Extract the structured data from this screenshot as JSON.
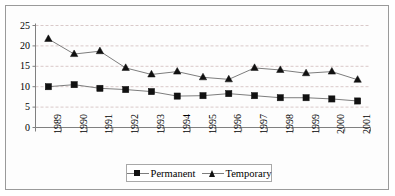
{
  "chart_data": {
    "type": "line",
    "title": "",
    "subtitle": "",
    "xlabel": "",
    "ylabel": "",
    "categories": [
      "1989",
      "1990",
      "1991",
      "1992",
      "1993",
      "1994",
      "1995",
      "1996",
      "1997",
      "1998",
      "1999",
      "2000",
      "2001"
    ],
    "series": [
      {
        "name": "Permanent",
        "marker": "square",
        "values": [
          10.0,
          10.5,
          9.6,
          9.3,
          8.8,
          7.7,
          7.8,
          8.3,
          7.8,
          7.3,
          7.3,
          7.0,
          6.5
        ]
      },
      {
        "name": "Temporary",
        "marker": "triangle",
        "values": [
          21.7,
          18.0,
          18.7,
          14.6,
          13.0,
          13.7,
          12.3,
          11.8,
          14.6,
          14.1,
          13.3,
          13.7,
          11.7
        ]
      }
    ],
    "ylim": [
      0,
      25
    ],
    "yticks": [
      0,
      5,
      10,
      15,
      20,
      25
    ],
    "ytick_labels": [
      "0",
      "5",
      "10",
      "15",
      "20",
      "25"
    ],
    "xtick_labels": [
      "1989",
      "1990",
      "1991",
      "1992",
      "1993",
      "1994",
      "1995",
      "1996",
      "1997",
      "1998",
      "1999",
      "2000",
      "2001"
    ],
    "xtick_rotation": 90,
    "grid": true,
    "grid_axis": "y",
    "grid_style": "dashed",
    "legend_position": "bottom-center",
    "colors": {
      "line": "#7d7d7d",
      "marker": "#111111",
      "grid": "#d9c9c9",
      "axis": "#808080",
      "border": "#9a9a9a",
      "background": "#fdfdfd"
    }
  },
  "legend": {
    "entries": [
      {
        "label": "Permanent",
        "marker": "square-marker-icon"
      },
      {
        "label": "Temporary",
        "marker": "triangle-marker-icon"
      }
    ]
  }
}
